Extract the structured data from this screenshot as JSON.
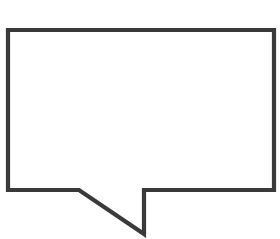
{
  "figure": {
    "kind": "speech-balloon-outline",
    "title": "Speech balloon outline",
    "canvas": {
      "width": 280,
      "height": 239,
      "background_color": "#ffffff"
    },
    "stroke": {
      "color": "#3a3a3a",
      "width": 4.2,
      "linejoin": "miter",
      "linecap": "butt"
    },
    "body": {
      "shape": "rectangle",
      "left": 8,
      "top": 30,
      "right": 274,
      "bottom": 190,
      "width": 266,
      "height": 160,
      "corner_style": "sharp",
      "fill": "none"
    },
    "tail": {
      "shape": "hooked-pointer",
      "attach_left_x": 79,
      "attach_right_x": 144,
      "attach_y": 190,
      "tip_x": 140,
      "tip_y": 234,
      "direction": "down",
      "side": "bottom",
      "alignment": "left-of-center"
    },
    "path": "M 8 30 L 274 30 L 274 190 L 144 190 L 144 234 L 79 190 L 8 190 Z",
    "vertices": [
      {
        "name": "top-left",
        "x": 8,
        "y": 30
      },
      {
        "name": "top-right",
        "x": 274,
        "y": 30
      },
      {
        "name": "bottom-right",
        "x": 274,
        "y": 190
      },
      {
        "name": "tail-right-base",
        "x": 144,
        "y": 190
      },
      {
        "name": "tail-tip",
        "x": 140,
        "y": 234
      },
      {
        "name": "tail-left-base",
        "x": 79,
        "y": 190
      },
      {
        "name": "bottom-left",
        "x": 8,
        "y": 190
      }
    ],
    "content": {
      "interior_text": "",
      "interior_fill": "#ffffff"
    }
  }
}
